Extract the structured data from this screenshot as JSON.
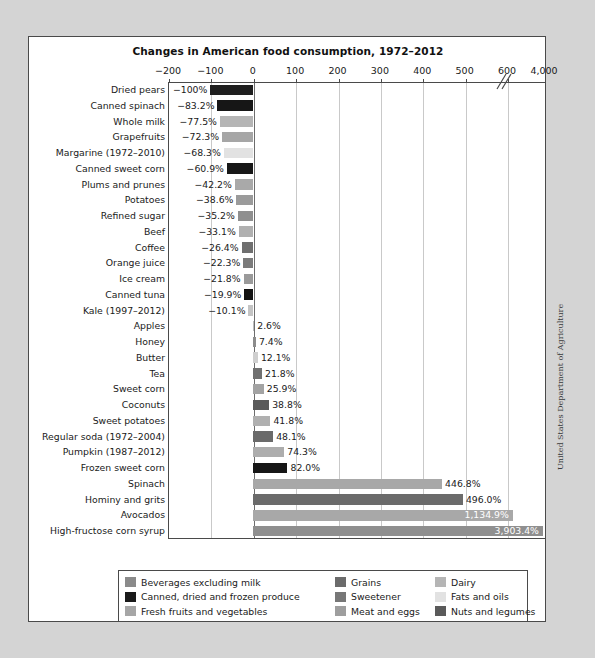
{
  "source_credit": "United States Department of Agriculture",
  "legend": {
    "items": [
      {
        "label": "Beverages excluding milk",
        "color": "#8a8a8a"
      },
      {
        "label": "Grains",
        "color": "#6b6b6b"
      },
      {
        "label": "Dairy",
        "color": "#b5b5b5"
      },
      {
        "label": "Canned, dried and frozen produce",
        "color": "#1a1a1a"
      },
      {
        "label": "Sweetener",
        "color": "#777777"
      },
      {
        "label": "Fats and oils",
        "color": "#e2e2e2"
      },
      {
        "label": "Fresh fruits and vegetables",
        "color": "#a6a6a6"
      },
      {
        "label": "Meat and eggs",
        "color": "#9e9e9e"
      },
      {
        "label": "Nuts and legumes",
        "color": "#5a5a5a"
      }
    ]
  },
  "chart_data": {
    "type": "bar",
    "orientation": "horizontal",
    "title": "Changes in American food consumption, 1972–2012",
    "xlabel": "",
    "ylabel": "",
    "grid": true,
    "legend_position": "bottom",
    "axis_break": {
      "after": 600,
      "before": 4000
    },
    "xticks": [
      {
        "value": -200,
        "label": "−200"
      },
      {
        "value": -100,
        "label": "−100"
      },
      {
        "value": 0,
        "label": "0"
      },
      {
        "value": 100,
        "label": "100"
      },
      {
        "value": 200,
        "label": "200"
      },
      {
        "value": 300,
        "label": "300"
      },
      {
        "value": 400,
        "label": "400"
      },
      {
        "value": 500,
        "label": "500"
      },
      {
        "value": 600,
        "label": "600"
      },
      {
        "value": 4000,
        "label": "4,000"
      }
    ],
    "xlim": [
      -200,
      4000
    ],
    "units": "percent change",
    "categories": [
      "Dried pears",
      "Canned spinach",
      "Whole milk",
      "Grapefruits",
      "Margarine (1972–2010)",
      "Canned sweet corn",
      "Plums and prunes",
      "Potatoes",
      "Refined sugar",
      "Beef",
      "Coffee",
      "Orange juice",
      "Ice cream",
      "Canned tuna",
      "Kale (1997–2012)",
      "Apples",
      "Honey",
      "Butter",
      "Tea",
      "Sweet corn",
      "Coconuts",
      "Sweet potatoes",
      "Regular soda (1972–2004)",
      "Pumpkin (1987–2012)",
      "Frozen sweet corn",
      "Spinach",
      "Hominy and grits",
      "Avocados",
      "High-fructose corn syrup"
    ],
    "values": [
      -100,
      -83.2,
      -77.5,
      -72.3,
      -68.3,
      -60.9,
      -42.2,
      -38.6,
      -35.2,
      -33.1,
      -26.4,
      -22.3,
      -21.8,
      -19.9,
      -10.1,
      2.6,
      7.4,
      12.1,
      21.8,
      25.9,
      38.8,
      41.8,
      48.1,
      74.3,
      82.0,
      446.8,
      496.0,
      1134.9,
      3903.4
    ],
    "value_labels": [
      "−100%",
      "−83.2%",
      "−77.5%",
      "−72.3%",
      "−68.3%",
      "−60.9%",
      "−42.2%",
      "−38.6%",
      "−35.2%",
      "−33.1%",
      "−26.4%",
      "−22.3%",
      "−21.8%",
      "−19.9%",
      "−10.1%",
      "2.6%",
      "7.4%",
      "12.1%",
      "21.8%",
      "25.9%",
      "38.8%",
      "41.8%",
      "48.1%",
      "74.3%",
      "82.0%",
      "446.8%",
      "496.0%",
      "1,134.9%",
      "3,903.4%"
    ],
    "group_names": [
      "Canned, dried and frozen produce",
      "Canned, dried and frozen produce",
      "Dairy",
      "Fresh fruits and vegetables",
      "Fats and oils",
      "Canned, dried and frozen produce",
      "Fresh fruits and vegetables",
      "Fresh fruits and vegetables",
      "Sweetener",
      "Meat and eggs",
      "Beverages excluding milk",
      "Beverages excluding milk",
      "Dairy",
      "Canned, dried and frozen produce",
      "Fresh fruits and vegetables",
      "Fresh fruits and vegetables",
      "Sweetener",
      "Fats and oils",
      "Beverages excluding milk",
      "Fresh fruits and vegetables",
      "Nuts and legumes",
      "Fresh fruits and vegetables",
      "Beverages excluding milk",
      "Fresh fruits and vegetables",
      "Canned, dried and frozen produce",
      "Fresh fruits and vegetables",
      "Grains",
      "Fresh fruits and vegetables",
      "Sweetener"
    ],
    "colors": [
      "#1f1f1f",
      "#161616",
      "#b5b5b5",
      "#a6a6a6",
      "#e2e2e2",
      "#171717",
      "#a9a9a9",
      "#9b9b9b",
      "#8f8f8f",
      "#b0b0b0",
      "#6f6f6f",
      "#7b7b7b",
      "#9a9a9a",
      "#121212",
      "#c4c4c4",
      "#bdbdbd",
      "#8c8c8c",
      "#cfcfcf",
      "#707070",
      "#a3a3a3",
      "#5a5a5a",
      "#b0b0b0",
      "#6a6a6a",
      "#adadad",
      "#161616",
      "#a8a8a8",
      "#6b6b6b",
      "#a8a8a8",
      "#8f8f8f"
    ]
  }
}
